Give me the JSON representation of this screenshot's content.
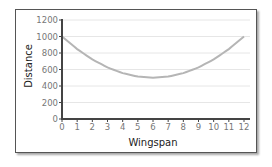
{
  "chart_data": {
    "type": "line",
    "title": "",
    "xlabel": "Wingspan",
    "ylabel": "Distance",
    "xlim": [
      0,
      12
    ],
    "ylim": [
      0,
      1200
    ],
    "x_ticks": [
      0,
      1,
      2,
      3,
      4,
      5,
      6,
      7,
      8,
      9,
      10,
      11,
      12
    ],
    "y_ticks": [
      0,
      200,
      400,
      600,
      800,
      1000,
      1200
    ],
    "grid": "horizontal",
    "legend": null,
    "series": [
      {
        "name": "Distance",
        "color": "#b5b5b5",
        "x": [
          0,
          1,
          2,
          3,
          4,
          5,
          6,
          7,
          8,
          9,
          10,
          11,
          12
        ],
        "y": [
          1000,
          847,
          722,
          625,
          556,
          514,
          500,
          514,
          556,
          625,
          722,
          847,
          1000
        ]
      }
    ]
  },
  "colors": {
    "axis": "#444444",
    "grid": "#e6e6e6",
    "curve": "#b5b5b5",
    "frame": "#555555"
  }
}
